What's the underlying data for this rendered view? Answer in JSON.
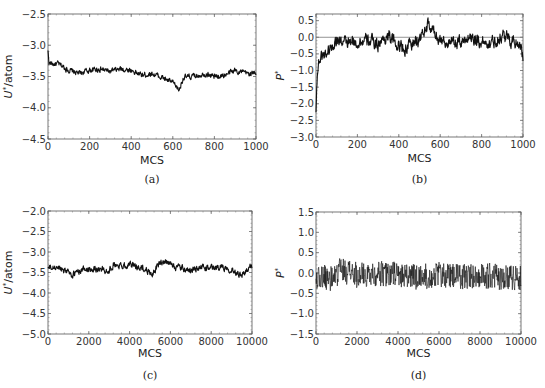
{
  "chart_data": [
    {
      "id": "a",
      "type": "line",
      "caption": "(a)",
      "xlabel": "MCS",
      "ylabel": "U*/atom",
      "xlim": [
        0,
        1000
      ],
      "ylim": [
        -4.5,
        -2.5
      ],
      "xticks": [
        0,
        200,
        400,
        600,
        800,
        1000
      ],
      "yticks": [
        -2.5,
        -3.0,
        -3.5,
        -4.0,
        -4.5
      ],
      "ytick_labels": [
        "-2.5",
        "-3.0",
        "-3.5",
        "-4.0",
        "-4.5"
      ],
      "xtick_labels": [
        "0",
        "200",
        "400",
        "600",
        "800",
        "1000"
      ],
      "reference_line": null,
      "noise": 0.05,
      "x": [
        0,
        5,
        20,
        50,
        100,
        150,
        200,
        250,
        300,
        350,
        400,
        450,
        500,
        550,
        600,
        630,
        650,
        700,
        750,
        800,
        850,
        900,
        950,
        1000
      ],
      "y": [
        -3.1,
        -3.28,
        -3.3,
        -3.3,
        -3.4,
        -3.45,
        -3.4,
        -3.38,
        -3.42,
        -3.38,
        -3.4,
        -3.48,
        -3.45,
        -3.52,
        -3.6,
        -3.72,
        -3.52,
        -3.5,
        -3.45,
        -3.5,
        -3.48,
        -3.4,
        -3.45,
        -3.45
      ]
    },
    {
      "id": "b",
      "type": "line",
      "caption": "(b)",
      "xlabel": "MCS",
      "ylabel": "P*",
      "xlim": [
        0,
        1000
      ],
      "ylim": [
        -3.0,
        0.7
      ],
      "xticks": [
        0,
        200,
        400,
        600,
        800,
        1000
      ],
      "yticks": [
        0.5,
        0.0,
        -0.5,
        -1.0,
        -1.5,
        -2.0,
        -2.5,
        -3.0
      ],
      "ytick_labels": [
        "0.5",
        "0.0",
        "-0.5",
        "-1.0",
        "-1.5",
        "-2.0",
        "-2.5",
        "-3.0"
      ],
      "xtick_labels": [
        "0",
        "200",
        "400",
        "600",
        "800",
        "1000"
      ],
      "reference_line": 0.0,
      "noise": 0.22,
      "x": [
        0,
        3,
        8,
        15,
        30,
        60,
        100,
        150,
        200,
        250,
        300,
        350,
        400,
        430,
        500,
        540,
        600,
        650,
        700,
        750,
        800,
        850,
        900,
        950,
        990,
        1000
      ],
      "y": [
        -2.3,
        -1.4,
        -1.0,
        -0.7,
        -0.55,
        -0.4,
        -0.05,
        -0.2,
        -0.15,
        -0.1,
        -0.2,
        0.05,
        -0.25,
        -0.35,
        -0.05,
        0.35,
        -0.05,
        -0.2,
        -0.15,
        0.05,
        -0.15,
        -0.15,
        0.05,
        -0.1,
        -0.2,
        -0.65
      ]
    },
    {
      "id": "c",
      "type": "line",
      "caption": "(c)",
      "xlabel": "MCS",
      "ylabel": "U*/atom",
      "xlim": [
        0,
        10000
      ],
      "ylim": [
        -5.0,
        -2.0
      ],
      "xticks": [
        0,
        2000,
        4000,
        6000,
        8000,
        10000
      ],
      "yticks": [
        -2.0,
        -2.5,
        -3.0,
        -3.5,
        -4.0,
        -4.5,
        -5.0
      ],
      "ytick_labels": [
        "-2.0",
        "-2.5",
        "-3.0",
        "-3.5",
        "-4.0",
        "-4.5",
        "-5.0"
      ],
      "xtick_labels": [
        "0",
        "2000",
        "4000",
        "6000",
        "8000",
        "10000"
      ],
      "reference_line": null,
      "noise": 0.09,
      "x": [
        0,
        500,
        1000,
        1200,
        1500,
        2000,
        2500,
        3000,
        3200,
        3500,
        4000,
        4500,
        5000,
        5100,
        5500,
        6000,
        6500,
        7000,
        7500,
        8000,
        8500,
        9000,
        9500,
        9800,
        10000
      ],
      "y": [
        -3.4,
        -3.38,
        -3.45,
        -3.58,
        -3.45,
        -3.4,
        -3.42,
        -3.45,
        -3.3,
        -3.35,
        -3.3,
        -3.38,
        -3.48,
        -3.55,
        -3.25,
        -3.3,
        -3.4,
        -3.45,
        -3.38,
        -3.4,
        -3.35,
        -3.42,
        -3.55,
        -3.45,
        -3.3
      ]
    },
    {
      "id": "d",
      "type": "line",
      "caption": "(d)",
      "xlabel": "MCS",
      "ylabel": "P*",
      "xlim": [
        0,
        10000
      ],
      "ylim": [
        -1.5,
        1.5
      ],
      "xticks": [
        0,
        2000,
        4000,
        6000,
        8000,
        10000
      ],
      "yticks": [
        1.5,
        1.0,
        0.5,
        0.0,
        -0.5,
        -1.0,
        -1.5
      ],
      "ytick_labels": [
        "1.5",
        "1.0",
        "0.5",
        "0.0",
        "-0.5",
        "-1.0",
        "-1.5"
      ],
      "xtick_labels": [
        "0",
        "2000",
        "4000",
        "6000",
        "8000",
        "10000"
      ],
      "reference_line": null,
      "noise": 0.32,
      "x": [
        0,
        1000,
        1100,
        2000,
        3000,
        4000,
        5000,
        6000,
        7000,
        8000,
        9000,
        10000
      ],
      "y": [
        -0.1,
        -0.15,
        0.1,
        -0.05,
        0.0,
        -0.05,
        -0.1,
        -0.05,
        -0.1,
        -0.05,
        -0.1,
        -0.1
      ]
    }
  ]
}
